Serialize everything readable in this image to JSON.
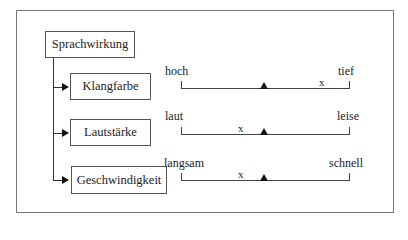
{
  "root": {
    "label": "Sprachwirkung"
  },
  "items": [
    {
      "label": "Klangfarbe",
      "left_pole": "hoch",
      "right_pole": "tief",
      "marker_pos": 0.87,
      "midpoint": 0.5
    },
    {
      "label": "Lautstärke",
      "left_pole": "laut",
      "right_pole": "leise",
      "marker_pos": 0.35,
      "midpoint": 0.5
    },
    {
      "label": "Geschwindigkeit",
      "left_pole": "langsam",
      "right_pole": "schnell",
      "marker_pos": 0.35,
      "midpoint": 0.5
    }
  ],
  "marker_symbol": "x"
}
